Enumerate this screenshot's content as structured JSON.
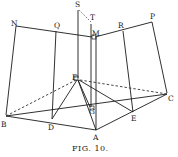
{
  "figure": {
    "caption": "FIG. 10.",
    "points": {
      "S": {
        "label": "S",
        "x": 78,
        "y": 9
      },
      "T": {
        "label": "T",
        "x": 92,
        "y": 19
      },
      "N": {
        "label": "N",
        "x": 16,
        "y": 26
      },
      "Q": {
        "label": "Q",
        "x": 56,
        "y": 28
      },
      "M": {
        "label": "M",
        "x": 95,
        "y": 36
      },
      "R": {
        "label": "R",
        "x": 122,
        "y": 27
      },
      "P": {
        "label": "P",
        "x": 152,
        "y": 19
      },
      "F": {
        "label": "F",
        "x": 78,
        "y": 79
      },
      "G": {
        "label": "G",
        "x": 92,
        "y": 108
      },
      "C": {
        "label": "C",
        "x": 167,
        "y": 96
      },
      "B": {
        "label": "B",
        "x": 7,
        "y": 117
      },
      "D": {
        "label": "D",
        "x": 52,
        "y": 120
      },
      "E": {
        "label": "E",
        "x": 133,
        "y": 111
      },
      "A": {
        "label": "A",
        "x": 96,
        "y": 131
      }
    }
  }
}
